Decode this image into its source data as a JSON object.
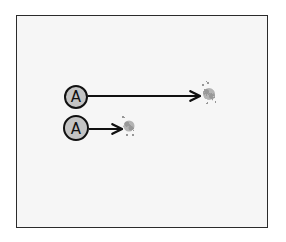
{
  "diagram": {
    "colors": {
      "frame_border": "#2b2b2b",
      "background": "#f6f6f6",
      "node_fill": "#c4c4c4",
      "node_stroke": "#111111",
      "arrow": "#111111",
      "cloud": "#9a9a9a"
    },
    "nodes": [
      {
        "label": "A",
        "cx": 76,
        "cy": 97,
        "r": 11
      },
      {
        "label": "A",
        "cx": 76,
        "cy": 128,
        "r": 12
      }
    ],
    "arrows": [
      {
        "from_x": 88,
        "to_x": 200,
        "y": 96
      },
      {
        "from_x": 89,
        "to_x": 122,
        "y": 129
      }
    ],
    "products": [
      {
        "cx": 209,
        "cy": 94
      },
      {
        "cx": 129,
        "cy": 126
      }
    ]
  }
}
